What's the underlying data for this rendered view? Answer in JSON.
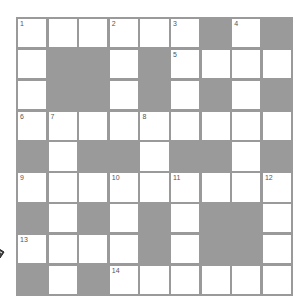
{
  "puzzle": {
    "rows": 9,
    "cols": 9,
    "layout": [
      "WWWWWWBWB",
      "WBBWBWWWW",
      "WBBWBWBWB",
      "WWWWWWWWW",
      "BWBBWBBWB",
      "WWWWWWWWW",
      "BWBWBWBBW",
      "WWWWBWBBW",
      "BWBWWWWWW"
    ],
    "numbers": [
      {
        "row": 0,
        "col": 0,
        "n": "1"
      },
      {
        "row": 0,
        "col": 3,
        "n": "2"
      },
      {
        "row": 0,
        "col": 5,
        "n": "3"
      },
      {
        "row": 0,
        "col": 7,
        "n": "4"
      },
      {
        "row": 1,
        "col": 5,
        "n": "5"
      },
      {
        "row": 3,
        "col": 0,
        "n": "6"
      },
      {
        "row": 3,
        "col": 1,
        "n": "7"
      },
      {
        "row": 3,
        "col": 4,
        "n": "8"
      },
      {
        "row": 5,
        "col": 0,
        "n": "9"
      },
      {
        "row": 5,
        "col": 3,
        "n": "10"
      },
      {
        "row": 5,
        "col": 5,
        "n": "11"
      },
      {
        "row": 5,
        "col": 8,
        "n": "12"
      },
      {
        "row": 7,
        "col": 0,
        "n": "13"
      },
      {
        "row": 8,
        "col": 3,
        "n": "14"
      }
    ],
    "colors": {
      "block": "#9a9a9a",
      "cell": "#ffffff",
      "number": "#555555"
    }
  },
  "cursor": {
    "icon": "pencil-cursor-icon"
  }
}
